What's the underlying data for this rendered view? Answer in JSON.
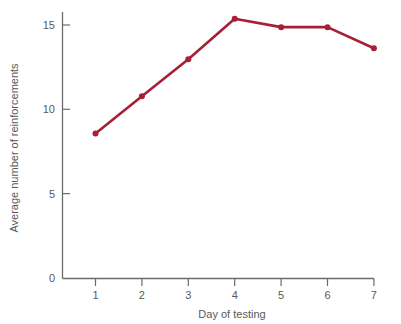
{
  "chart_data": {
    "type": "line",
    "title": "",
    "subtitle": "",
    "xlabel": "Day of testing",
    "ylabel": "Average number of reinforcements",
    "categories": [
      "1",
      "2",
      "3",
      "4",
      "5",
      "6",
      "7"
    ],
    "x": [
      1,
      2,
      3,
      4,
      5,
      6,
      7
    ],
    "values": [
      8.6,
      10.8,
      13.0,
      15.4,
      14.9,
      14.9,
      13.65
    ],
    "series": [
      {
        "name": "Average number of reinforcements",
        "values": [
          8.6,
          10.8,
          13.0,
          15.4,
          14.9,
          14.9,
          13.65
        ]
      }
    ],
    "xlim": [
      0.5,
      7.3
    ],
    "ylim": [
      0,
      16.3
    ],
    "xticks": [
      1,
      2,
      3,
      4,
      5,
      6,
      7
    ],
    "xtick_labels": [
      "1",
      "2",
      "3",
      "4",
      "5",
      "6",
      "7"
    ],
    "yticks": [
      0,
      5,
      10,
      15
    ],
    "ytick_labels": [
      "0",
      "5",
      "10",
      "15"
    ],
    "grid": false,
    "legend": false,
    "legend_position": "none",
    "markers": "circle",
    "line_color": "#a52036",
    "marker_color": "#a52036",
    "axis_color": "#6b6b6d",
    "text_color": "#59595b",
    "background_color": "#ffffff"
  },
  "axes": {
    "y_title": "Average number of reinforcements",
    "x_title": "Day of testing",
    "y_tick_0": "0",
    "y_tick_1": "5",
    "y_tick_2": "10",
    "y_tick_3": "15",
    "x_tick_0": "1",
    "x_tick_1": "2",
    "x_tick_2": "3",
    "x_tick_3": "4",
    "x_tick_4": "5",
    "x_tick_5": "6",
    "x_tick_6": "7"
  }
}
